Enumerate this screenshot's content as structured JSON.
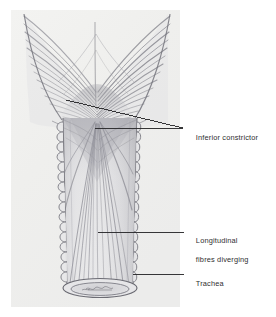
{
  "figure": {
    "name": "inferior-constrictor-trachea-illustration",
    "medium": "pencil-shaded anatomical drawing",
    "panel": {
      "paper_tone": "#f0f0ee",
      "left": 11,
      "top": 10,
      "right": 180,
      "bottom": 307
    },
    "ink": {
      "leader_line_color": "#2b2b2d",
      "outline_color": "#6f6f74",
      "fibre_color": "#8d8d94",
      "shadow_color": "#a8a8ae",
      "text_color": "#2e2e30"
    }
  },
  "labels": [
    {
      "id": "inferior-constrictor",
      "text": "Inferior constrictor",
      "lines": [
        "Inferior constrictor"
      ],
      "text_x": 187,
      "text_y": 124,
      "leaders": [
        {
          "x1": 66,
          "y1": 100,
          "x2": 183,
          "y2": 128
        },
        {
          "x1": 95,
          "y1": 128.5,
          "x2": 183,
          "y2": 128.5
        }
      ]
    },
    {
      "id": "longitudinal-fibres-diverging",
      "text": "Longitudinal fibres diverging",
      "lines": [
        "Longitudinal",
        "fibres diverging"
      ],
      "text_x": 187,
      "text_y": 227,
      "leaders": [
        {
          "x1": 98,
          "y1": 232,
          "x2": 184,
          "y2": 232
        }
      ]
    },
    {
      "id": "trachea",
      "text": "Trachea",
      "lines": [
        "Trachea"
      ],
      "text_x": 187,
      "text_y": 270,
      "leaders": [
        {
          "x1": 133,
          "y1": 274,
          "x2": 184,
          "y2": 274
        }
      ]
    }
  ],
  "structures": {
    "inferior_constrictor": {
      "name": "Inferior constrictor muscle",
      "description": "Fan of oblique muscle fibres forming a chevron that converges on the midline raphe above the trachea",
      "fibre_rows": 17
    },
    "midline_raphe": {
      "name": "Median raphe",
      "apex_x": 95,
      "apex_y": 22
    },
    "longitudinal_fibres": {
      "name": "Longitudinal fibres diverging",
      "apex_x": 96,
      "apex_y": 122,
      "spread_count": 22
    },
    "trachea": {
      "name": "Trachea",
      "left_wall_x": 63,
      "right_wall_x": 137,
      "top_y": 118,
      "bottom_y": 292,
      "cartilage_ring_count": 16,
      "lumen_ellipse": {
        "cx": 100,
        "cy": 288,
        "rx": 37,
        "ry": 9
      }
    }
  }
}
